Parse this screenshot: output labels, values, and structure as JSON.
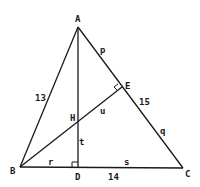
{
  "diagram": {
    "type": "triangle-with-altitudes",
    "vertices": {
      "A": {
        "label": "A",
        "x": 78,
        "y": 27
      },
      "B": {
        "label": "B",
        "x": 20,
        "y": 167
      },
      "C": {
        "label": "C",
        "x": 183,
        "y": 168
      },
      "D": {
        "label": "D",
        "x": 78,
        "y": 167
      },
      "E": {
        "label": "E",
        "x": 122,
        "y": 87
      },
      "H": {
        "label": "H",
        "x": 78,
        "y": 121
      }
    },
    "side_lengths": {
      "AB": "13",
      "AC": "15",
      "BC": "14"
    },
    "segment_variables": {
      "AE": "p",
      "EC": "q",
      "BD": "r",
      "DC": "s",
      "HD": "t",
      "HE": "u"
    },
    "right_angles": [
      "D",
      "E"
    ]
  }
}
